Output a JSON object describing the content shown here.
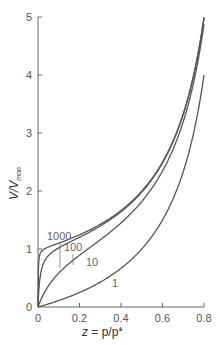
{
  "chart_data": {
    "type": "line",
    "title": "",
    "xlabel": "z = p/p*",
    "ylabel": "V/Vmon",
    "xlim": [
      0,
      0.8
    ],
    "ylim": [
      0,
      5
    ],
    "xticks": [
      "0",
      "0.2",
      "0.4",
      "0.6",
      "0.8"
    ],
    "yticks": [
      "0",
      "1",
      "2",
      "3",
      "4",
      "5"
    ],
    "grid": false,
    "legend": "inline curve labels",
    "model": "BET isotherm: V/Vmon = c z / ((1 - z)(1 - z + c z))",
    "series": [
      {
        "name": "1000",
        "c": 1000,
        "x": [
          0,
          0.05,
          0.1,
          0.2,
          0.3,
          0.4,
          0.5,
          0.6,
          0.7,
          0.8
        ],
        "values": [
          0,
          1.05,
          1.11,
          1.25,
          1.43,
          1.67,
          2.0,
          2.5,
          3.33,
          4.99
        ]
      },
      {
        "name": "100",
        "c": 100,
        "x": [
          0,
          0.05,
          0.1,
          0.2,
          0.3,
          0.4,
          0.5,
          0.6,
          0.7,
          0.8
        ],
        "values": [
          0,
          0.88,
          1.02,
          1.21,
          1.41,
          1.66,
          1.98,
          2.49,
          3.32,
          4.95
        ]
      },
      {
        "name": "10",
        "c": 10,
        "x": [
          0,
          0.05,
          0.1,
          0.2,
          0.3,
          0.4,
          0.5,
          0.6,
          0.7,
          0.8
        ],
        "values": [
          0,
          0.36,
          0.58,
          0.89,
          1.16,
          1.46,
          1.82,
          2.34,
          3.18,
          4.76
        ]
      },
      {
        "name": "1",
        "c": 1,
        "x": [
          0,
          0.05,
          0.1,
          0.2,
          0.3,
          0.4,
          0.5,
          0.6,
          0.7,
          0.8
        ],
        "values": [
          0,
          0.05,
          0.11,
          0.25,
          0.43,
          0.67,
          1.0,
          1.5,
          2.33,
          4.0
        ]
      }
    ],
    "annotations": [
      {
        "text": "1000",
        "x": 0.04,
        "y": 1.75
      },
      {
        "text": "100",
        "x": 0.12,
        "y": 1.55
      },
      {
        "text": "10",
        "x": 0.2,
        "y": 0.9
      },
      {
        "text": "1",
        "x": 0.37,
        "y": 0.15
      }
    ]
  },
  "labels": {
    "xlabel_z": "z",
    "xlabel_rest": " = p/p*",
    "ylabel_main": "V/V",
    "ylabel_sub": "mon"
  },
  "colors": {
    "axis": "#666666",
    "curve": "#555555",
    "text": "#555555"
  }
}
